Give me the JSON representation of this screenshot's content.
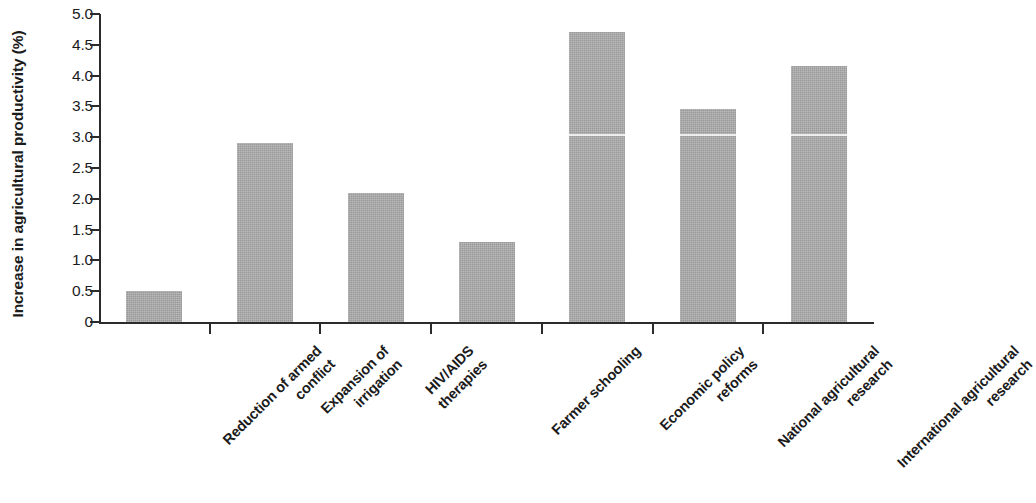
{
  "chart_data": {
    "type": "bar",
    "title": "",
    "subtitle": "",
    "xlabel": "",
    "ylabel": "Increase in agricultural productivity (%)",
    "categories": [
      "Reduction of armed conflict",
      "Expansion of irrigation",
      "HIV/AIDS therapies",
      "Farmer schooling",
      "Economic policy reforms",
      "National agricultural research",
      "International agricultural research"
    ],
    "category_lines": [
      [
        "Reduction of armed",
        "conflict"
      ],
      [
        "Expansion of",
        "irrigation"
      ],
      [
        "HIV/AIDS",
        "therapies"
      ],
      [
        "Farmer schooling"
      ],
      [
        "Economic policy",
        "reforms"
      ],
      [
        "National agricultural",
        "research"
      ],
      [
        "International agricultural",
        "research"
      ]
    ],
    "values": [
      0.5,
      2.9,
      2.1,
      1.3,
      4.7,
      3.45,
      4.15
    ],
    "ylim": [
      0,
      5.0
    ],
    "ytick_values": [
      0,
      0.5,
      1.0,
      1.5,
      2.0,
      2.5,
      3.0,
      3.5,
      4.0,
      4.5,
      5.0
    ],
    "ytick_labels": [
      "0",
      "0.5",
      "1.0",
      "1.5",
      "2.0",
      "2.5",
      "3.0",
      "3.5",
      "4.0",
      "4.5",
      "5.0"
    ],
    "grid": false,
    "legend": false,
    "legend_position": "none",
    "bar_color": "#a9a9a9",
    "axis_color": "#2b2b2b",
    "text_color": "#1b1b1b",
    "xtick_label_rotation": -45
  }
}
